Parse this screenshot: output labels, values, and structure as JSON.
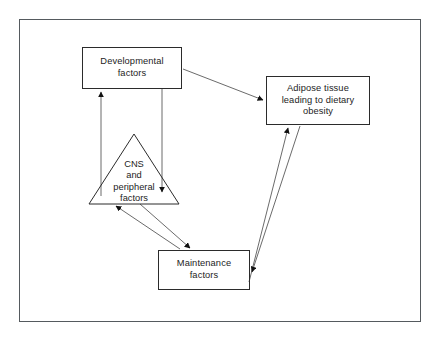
{
  "diagram": {
    "title": "",
    "frame": {
      "border_color": "#555a5e"
    },
    "nodes": {
      "developmental": {
        "label": "Developmental\nfactors",
        "shape": "rectangle"
      },
      "adipose": {
        "label": "Adipose tissue\nleading to dietary\nobesity",
        "shape": "rectangle"
      },
      "cns": {
        "label": "CNS\nand\nperipheral\nfactors",
        "shape": "triangle"
      },
      "maintenance": {
        "label": "Maintenance\nfactors",
        "shape": "rectangle"
      }
    },
    "edges": [
      {
        "name": "developmental-to-adipose",
        "from": "developmental",
        "to": "adipose",
        "direction": "one-way"
      },
      {
        "name": "cns-to-developmental",
        "from": "cns",
        "to": "developmental",
        "direction": "one-way"
      },
      {
        "name": "developmental-to-cns",
        "from": "developmental",
        "to": "cns",
        "direction": "one-way"
      },
      {
        "name": "maintenance-to-cns",
        "from": "maintenance",
        "to": "cns",
        "direction": "one-way"
      },
      {
        "name": "cns-to-maintenance",
        "from": "cns",
        "to": "maintenance",
        "direction": "one-way"
      },
      {
        "name": "maintenance-to-adipose",
        "from": "maintenance",
        "to": "adipose",
        "direction": "one-way"
      },
      {
        "name": "adipose-to-maintenance",
        "from": "adipose",
        "to": "maintenance",
        "direction": "one-way"
      }
    ],
    "colors": {
      "node_stroke": "#2b2b2b",
      "edge_stroke": "#6b6b6b",
      "arrowhead": "#111111",
      "text": "#1d1d1d",
      "background": "#ffffff"
    }
  }
}
